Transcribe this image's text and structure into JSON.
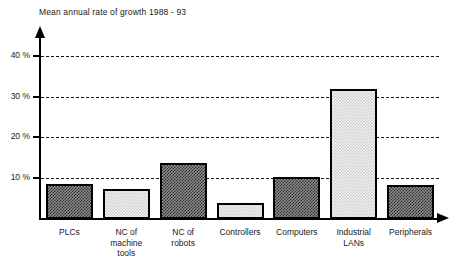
{
  "chart_data": {
    "type": "bar",
    "title": "Mean annual rate of growth 1988 - 93",
    "xlabel": "",
    "ylabel": "",
    "ylim": [
      0,
      45
    ],
    "grid": true,
    "legend": "none",
    "yticks": [
      {
        "value": 10,
        "label": "10 %"
      },
      {
        "value": 20,
        "label": "20 %"
      },
      {
        "value": 30,
        "label": "30 %"
      },
      {
        "value": 40,
        "label": "40 %"
      }
    ],
    "categories": [
      "PLCs",
      "NC of machine tools",
      "NC of robots",
      "Controllers",
      "Computers",
      "Industrial LANs",
      "Peripherals"
    ],
    "category_lines": [
      [
        "PLCs"
      ],
      [
        "NC of",
        "machine",
        "tools"
      ],
      [
        "NC of",
        "robots"
      ],
      [
        "Controllers"
      ],
      [
        "Computers"
      ],
      [
        "Industrial",
        "LANs"
      ],
      [
        "Peripherals"
      ]
    ],
    "values": [
      8.6,
      7.5,
      13.8,
      4.0,
      10.5,
      32.2,
      8.3
    ],
    "bar_fills": [
      "dark",
      "light",
      "dark",
      "light",
      "dark",
      "light",
      "dark"
    ]
  },
  "caption": {
    "fragment": ""
  },
  "colors": {
    "axis": "#000000",
    "grid": "#111111",
    "bar_dark": "#2b2b2b",
    "bar_light": "#c9c9c9",
    "text": "#1a1a1a",
    "background": "#ffffff"
  }
}
